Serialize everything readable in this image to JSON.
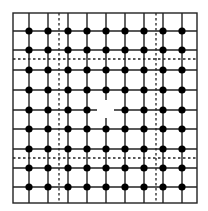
{
  "diagram": {
    "type": "grid-graph",
    "width": 208,
    "height": 211,
    "border": {
      "x1": 13,
      "y1": 13,
      "x2": 197,
      "y2": 203
    },
    "columns": [
      29,
      48,
      68,
      87,
      106,
      125,
      144,
      163,
      182
    ],
    "rows": [
      31,
      50,
      70,
      90,
      110,
      129,
      149,
      168,
      187
    ],
    "dashed_vertical_x": [
      59,
      156
    ],
    "dashed_horizontal_y": [
      59,
      158
    ],
    "missing_node": {
      "col": 4,
      "row": 4,
      "stubs": {
        "left": 97,
        "right": 114,
        "top": 100,
        "bottom": 118
      }
    },
    "node_radius": 3.6,
    "colors": {
      "line": "#222222",
      "node": "#000000",
      "background": "#ffffff"
    }
  }
}
